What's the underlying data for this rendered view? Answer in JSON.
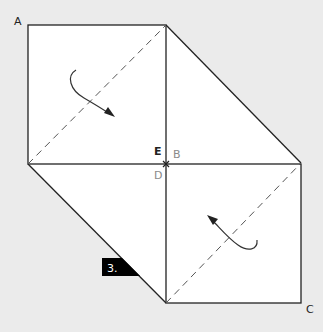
{
  "diagram": {
    "step_badge": "3.",
    "labels": {
      "A": "A",
      "B": "B",
      "C": "C",
      "D": "D",
      "E": "E"
    },
    "colors": {
      "background": "#ebebeb",
      "paper": "#ffffff",
      "line": "#222222",
      "fold_line": "#555555",
      "label_dark": "#222222",
      "label_light": "#8a8a8a",
      "badge_bg": "#000000",
      "badge_text": "#ffffff"
    },
    "shapes": {
      "upper_square": "A-top-left folded along dashed diagonal",
      "lower_square": "C-bottom-right folded along dashed diagonal",
      "fold_arrows": [
        "upper-fold-arrow",
        "lower-fold-arrow"
      ]
    }
  }
}
